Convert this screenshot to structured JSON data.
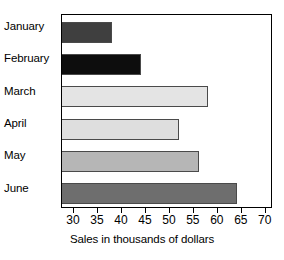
{
  "chart_data": {
    "type": "bar",
    "orientation": "horizontal",
    "title": "",
    "xlabel": "Sales in thousands of dollars",
    "ylabel": "",
    "categories": [
      "January",
      "February",
      "March",
      "April",
      "May",
      "June"
    ],
    "values": [
      38,
      44,
      58,
      52,
      56,
      64
    ],
    "series": [
      {
        "name": "Sales",
        "values": [
          38,
          44,
          58,
          52,
          56,
          64
        ]
      }
    ],
    "bar_colors": [
      "#3f3f3f",
      "#0d0d0d",
      "#e4e4e4",
      "#dedede",
      "#b6b6b6",
      "#6e6e6e"
    ],
    "xlim": [
      27.5,
      71.5
    ],
    "xticks": [
      30,
      35,
      40,
      45,
      50,
      55,
      60,
      65,
      70
    ],
    "xticklabels": [
      "30",
      "35",
      "40",
      "45",
      "50",
      "55",
      "60",
      "65",
      "70"
    ],
    "grid": false,
    "legend": false
  }
}
